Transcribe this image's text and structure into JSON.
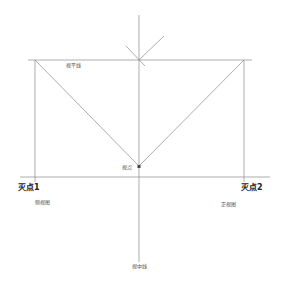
{
  "diagram": {
    "labels": {
      "horizon_line": "视平线",
      "viewpoint": "视点",
      "vanishing_point_1": "灭点1",
      "vanishing_point_2": "灭点2",
      "side_view": "侧视图",
      "front_view": "正视图",
      "center_line": "视中线"
    },
    "colors": {
      "line": "#8a8a8a",
      "text": "#333333",
      "background": "#ffffff"
    }
  }
}
